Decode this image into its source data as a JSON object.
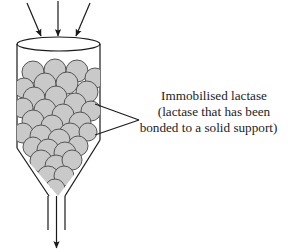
{
  "figure": {
    "name": "immobilised-lactase-column"
  },
  "annotation": {
    "lines": [
      "Immobilised lactase",
      "(lactase that has been",
      "bonded to a solid support)"
    ],
    "leader": "two-pronged-pointer"
  },
  "colors": {
    "stroke": "#1a1a1a",
    "bead_fill": "#c9c9c9",
    "bead_stroke": "#555555",
    "background": "#ffffff",
    "text": "#1c1c1c"
  },
  "geometry": {
    "cylinder": {
      "left": 17,
      "right": 100,
      "top": 42,
      "body_bottom": 146,
      "rim_ry": 7
    },
    "funnel": {
      "apex_x": 58,
      "apex_y": 196,
      "left_start_y": 148,
      "right_start_y": 140
    },
    "outlet": {
      "left_x": 47,
      "right_x": 65,
      "top_y": 196,
      "bottom_y": 232
    },
    "inlet_arrows": 3,
    "outlet_arrows": 1
  },
  "beads": [
    {
      "cx": 33,
      "cy": 72,
      "r": 11
    },
    {
      "cx": 55,
      "cy": 70,
      "r": 11
    },
    {
      "cx": 77,
      "cy": 71,
      "r": 11
    },
    {
      "cx": 95,
      "cy": 78,
      "r": 10
    },
    {
      "cx": 45,
      "cy": 84,
      "r": 11
    },
    {
      "cx": 67,
      "cy": 83,
      "r": 11
    },
    {
      "cx": 24,
      "cy": 88,
      "r": 10
    },
    {
      "cx": 87,
      "cy": 92,
      "r": 11
    },
    {
      "cx": 34,
      "cy": 98,
      "r": 11
    },
    {
      "cx": 56,
      "cy": 97,
      "r": 11
    },
    {
      "cx": 75,
      "cy": 104,
      "r": 11
    },
    {
      "cx": 23,
      "cy": 108,
      "r": 10
    },
    {
      "cx": 45,
      "cy": 110,
      "r": 11
    },
    {
      "cx": 63,
      "cy": 115,
      "r": 11
    },
    {
      "cx": 91,
      "cy": 111,
      "r": 10
    },
    {
      "cx": 33,
      "cy": 121,
      "r": 11
    },
    {
      "cx": 52,
      "cy": 126,
      "r": 11
    },
    {
      "cx": 80,
      "cy": 123,
      "r": 11
    },
    {
      "cx": 23,
      "cy": 133,
      "r": 10
    },
    {
      "cx": 41,
      "cy": 136,
      "r": 11
    },
    {
      "cx": 70,
      "cy": 134,
      "r": 11
    },
    {
      "cx": 88,
      "cy": 132,
      "r": 9
    },
    {
      "cx": 59,
      "cy": 140,
      "r": 11
    },
    {
      "cx": 33,
      "cy": 147,
      "r": 10
    },
    {
      "cx": 48,
      "cy": 150,
      "r": 11
    },
    {
      "cx": 78,
      "cy": 146,
      "r": 10
    },
    {
      "cx": 65,
      "cy": 153,
      "r": 11
    },
    {
      "cx": 41,
      "cy": 161,
      "r": 11
    },
    {
      "cx": 56,
      "cy": 166,
      "r": 11
    },
    {
      "cx": 72,
      "cy": 160,
      "r": 10
    },
    {
      "cx": 48,
      "cy": 177,
      "r": 11
    },
    {
      "cx": 64,
      "cy": 176,
      "r": 10
    },
    {
      "cx": 55,
      "cy": 189,
      "r": 10
    }
  ]
}
